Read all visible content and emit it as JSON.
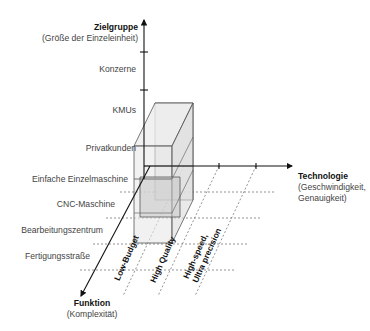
{
  "axes": {
    "y": {
      "title": "Zielgruppe",
      "subtitle": "(Größe der Einzeleinheit)"
    },
    "x": {
      "title": "Technologie",
      "subtitle_line1": "(Geschwindigkeit,",
      "subtitle_line2": "Genauigkeit)"
    },
    "z": {
      "title": "Funktion",
      "subtitle": "(Komplexität)"
    }
  },
  "y_labels": [
    "Konzerne",
    "KMUs",
    "Privatkunden"
  ],
  "z_labels": [
    "Einfache Einzelmaschine",
    "CNC-Maschine",
    "Bearbeitungszentrum",
    "Fertigungsstraße"
  ],
  "x_labels": [
    "Low-Budget",
    "High Quality",
    "High-speed,",
    "Ultra precision"
  ],
  "colors": {
    "axis": "#111111",
    "box_fill": "#d8d8d8",
    "box_edge": "#555555",
    "dashed": "#666666"
  }
}
